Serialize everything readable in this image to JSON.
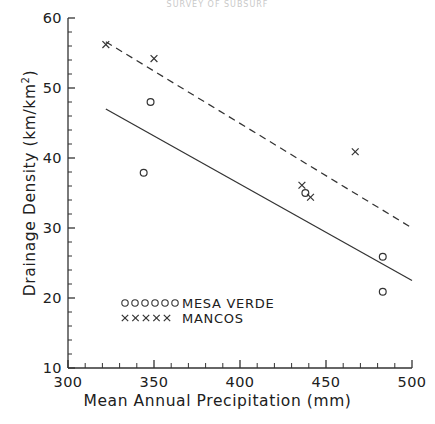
{
  "figure": {
    "cut_off_title": "SURVEY OF SUBSURF",
    "x_axis_label": "Mean Annual Precipitation (mm)",
    "y_axis_label_prefix": "Drainage Density (km/km",
    "y_axis_label_exp": "2",
    "y_axis_label_suffix": ")"
  },
  "legend": {
    "entries": [
      {
        "name": "mesa-verde",
        "label": "MESA  VERDE",
        "marker": "circle-marker",
        "count": 6
      },
      {
        "name": "mancos",
        "label": "MANCOS",
        "marker": "cross-marker",
        "count": 5
      }
    ],
    "x": 125,
    "y_circle": 303,
    "y_cross": 318,
    "text_x": 182
  },
  "chart_data": {
    "type": "scatter",
    "title": "",
    "xlabel": "Mean Annual Precipitation (mm)",
    "ylabel": "Drainage Density (km/km2)",
    "xlim": [
      300,
      500
    ],
    "ylim": [
      10,
      60
    ],
    "grid": false,
    "legend_position": "inside-lower-left",
    "x_major_ticks": [
      300,
      350,
      400,
      450,
      500
    ],
    "x_major_tick_labels": [
      "300",
      "350",
      "400",
      "450",
      "500"
    ],
    "x_minor_tick_step": 10,
    "y_major_ticks": [
      10,
      20,
      30,
      40,
      50,
      60
    ],
    "y_major_tick_labels": [
      "10",
      "20",
      "30",
      "40",
      "50",
      "60"
    ],
    "y_minor_tick_step": 2,
    "series": [
      {
        "name": "MESA  VERDE",
        "marker": "circle",
        "points": [
          {
            "x": 348,
            "y": 48.0
          },
          {
            "x": 344,
            "y": 37.9
          },
          {
            "x": 438,
            "y": 35.0
          },
          {
            "x": 483,
            "y": 25.9
          },
          {
            "x": 483,
            "y": 20.9
          }
        ],
        "trendline": {
          "style": "solid",
          "x1": 322,
          "y1": 47.0,
          "x2": 500,
          "y2": 22.5
        }
      },
      {
        "name": "MANCOS",
        "marker": "cross",
        "points": [
          {
            "x": 322,
            "y": 56.2
          },
          {
            "x": 350,
            "y": 54.2
          },
          {
            "x": 436,
            "y": 36.1
          },
          {
            "x": 441,
            "y": 34.4
          },
          {
            "x": 467,
            "y": 40.9
          }
        ],
        "trendline": {
          "style": "dashed",
          "x1": 322,
          "y1": 56.6,
          "x2": 500,
          "y2": 30.0
        }
      }
    ]
  },
  "geometry": {
    "left": 68,
    "right": 412,
    "top": 18,
    "bottom": 368
  }
}
